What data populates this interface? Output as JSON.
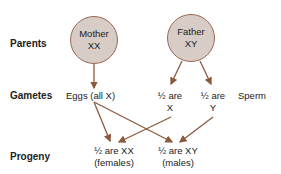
{
  "rows": {
    "parents": "Parents",
    "gametes": "Gametes",
    "progeny": "Progeny"
  },
  "mother": {
    "name": "Mother",
    "genotype": "XX"
  },
  "father": {
    "name": "Father",
    "genotype": "XY"
  },
  "gametes": {
    "eggs": "Eggs (all X)",
    "half_x_line1": "½ are",
    "half_x_line2": "X",
    "half_y_line1": "½ are",
    "half_y_line2": "Y",
    "sperm": "Sperm"
  },
  "progeny": {
    "females_line1": "½ are XX",
    "females_line2": "(females)",
    "males_line1": "½ are XY",
    "males_line2": "(males)"
  },
  "colors": {
    "arrow": "#8b5a3c",
    "circle_fill": "#d7ccc6",
    "circle_border": "#9a6a55"
  }
}
